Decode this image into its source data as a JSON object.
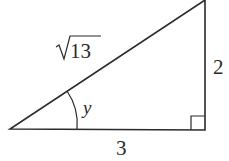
{
  "diagram": {
    "type": "right-triangle",
    "hypotenuse_label": "13",
    "hypotenuse_radical": "√",
    "vertical_side_label": "2",
    "horizontal_side_label": "3",
    "angle_label": "y",
    "colors": {
      "stroke": "#2a2a2a",
      "background": "#ffffff"
    }
  }
}
